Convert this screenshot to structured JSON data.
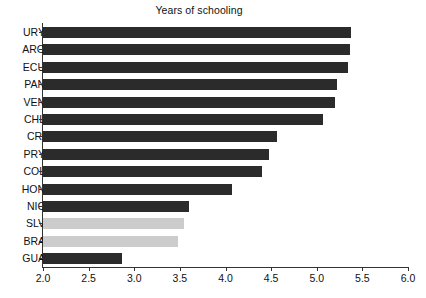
{
  "chart_data": {
    "type": "bar",
    "orientation": "horizontal",
    "title": "Years of schooling",
    "xlabel": "",
    "ylabel": "",
    "xlim": [
      2.0,
      6.0
    ],
    "xticks": [
      "2.0",
      "2.5",
      "3.0",
      "3.5",
      "4.0",
      "4.5",
      "5.0",
      "5.5",
      "6.0"
    ],
    "xtick_values": [
      2.0,
      2.5,
      3.0,
      3.5,
      4.0,
      4.5,
      5.0,
      5.5,
      6.0
    ],
    "grid": false,
    "legend": "none",
    "bar_colors": {
      "default": "#2b2b2b",
      "highlight": "#cccccc"
    },
    "categories": [
      "URY",
      "ARG",
      "ECU",
      "PAN",
      "VEN",
      "CHL",
      "CRI",
      "PRY",
      "COL",
      "HON",
      "NIC",
      "SLV",
      "BRA",
      "GUA"
    ],
    "values": [
      5.37,
      5.36,
      5.34,
      5.22,
      5.2,
      5.07,
      4.56,
      4.48,
      4.4,
      4.07,
      3.6,
      3.55,
      3.48,
      2.87
    ],
    "bars": [
      {
        "label": "URY",
        "value": 5.37,
        "color": "#2b2b2b"
      },
      {
        "label": "ARG",
        "value": 5.36,
        "color": "#2b2b2b"
      },
      {
        "label": "ECU",
        "value": 5.34,
        "color": "#2b2b2b"
      },
      {
        "label": "PAN",
        "value": 5.22,
        "color": "#2b2b2b"
      },
      {
        "label": "VEN",
        "value": 5.2,
        "color": "#2b2b2b"
      },
      {
        "label": "CHL",
        "value": 5.07,
        "color": "#2b2b2b"
      },
      {
        "label": "CRI",
        "value": 4.56,
        "color": "#2b2b2b"
      },
      {
        "label": "PRY",
        "value": 4.48,
        "color": "#2b2b2b"
      },
      {
        "label": "COL",
        "value": 4.4,
        "color": "#2b2b2b"
      },
      {
        "label": "HON",
        "value": 4.07,
        "color": "#2b2b2b"
      },
      {
        "label": "NIC",
        "value": 3.6,
        "color": "#2b2b2b"
      },
      {
        "label": "SLV",
        "value": 3.55,
        "color": "#cccccc"
      },
      {
        "label": "BRA",
        "value": 3.48,
        "color": "#cccccc"
      },
      {
        "label": "GUA",
        "value": 2.87,
        "color": "#2b2b2b"
      }
    ]
  }
}
